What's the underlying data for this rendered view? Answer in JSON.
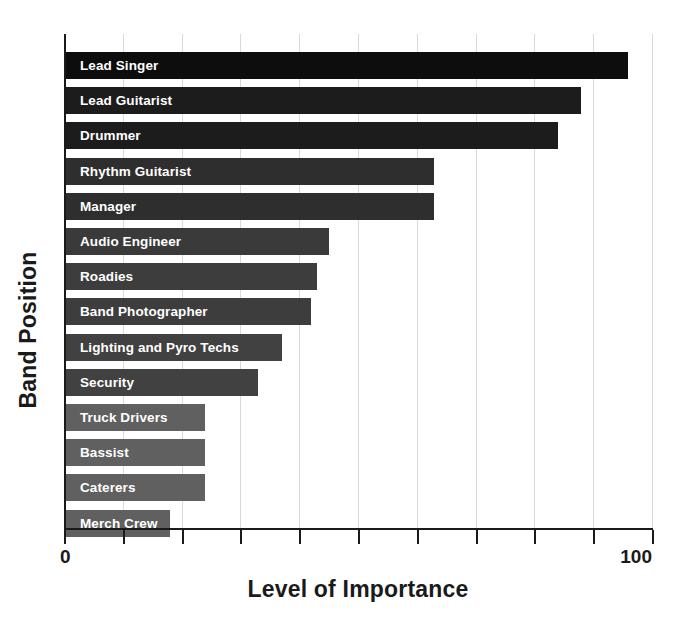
{
  "chart_data": {
    "type": "bar",
    "orientation": "horizontal",
    "title": "",
    "xlabel": "Level of Importance",
    "ylabel": "Band Position",
    "xlim": [
      0,
      100
    ],
    "xticks": [
      0,
      10,
      20,
      30,
      40,
      50,
      60,
      70,
      80,
      90,
      100
    ],
    "xtick_labels": [
      "0",
      "",
      "",
      "",
      "",
      "",
      "",
      "",
      "",
      "",
      "100"
    ],
    "grid": "vertical",
    "legend": "none",
    "categories": [
      "Lead Singer",
      "Lead Guitarist",
      "Drummer",
      "Rhythm Guitarist",
      "Manager",
      "Audio Engineer",
      "Roadies",
      "Band Photographer",
      "Lighting and Pyro Techs",
      "Security",
      "Truck Drivers",
      "Bassist",
      "Caterers",
      "Merch Crew"
    ],
    "values": [
      96,
      88,
      84,
      63,
      63,
      45,
      43,
      42,
      37,
      33,
      24,
      24,
      24,
      18
    ],
    "bar_colors": [
      "#0d0d0d",
      "#1c1c1c",
      "#1c1c1c",
      "#2e2e2e",
      "#2e2e2e",
      "#3a3a3a",
      "#3d3d3d",
      "#3d3d3d",
      "#414141",
      "#414141",
      "#606060",
      "#606060",
      "#606060",
      "#606060"
    ],
    "bar_label_color": "#ffffff"
  },
  "axes": {
    "x_title": "Level of Importance",
    "y_title": "Band Position",
    "x_min_label": "0",
    "x_max_label": "100"
  },
  "colors": {
    "background": "#ffffff",
    "axis": "#1a1a1a",
    "gridline": "#d9d9d9",
    "text": "#1a1a1a"
  }
}
